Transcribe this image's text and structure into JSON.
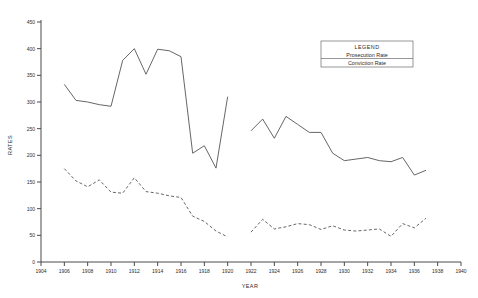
{
  "chart_data": {
    "type": "line",
    "title": "",
    "xlabel": "YEAR",
    "ylabel": "RATES",
    "xlim": [
      1904,
      1940
    ],
    "ylim": [
      0,
      450
    ],
    "xticks": [
      1904,
      1906,
      1908,
      1910,
      1912,
      1914,
      1916,
      1918,
      1920,
      1922,
      1924,
      1926,
      1928,
      1930,
      1932,
      1934,
      1936,
      1938,
      1940
    ],
    "yticks": [
      0,
      50,
      100,
      150,
      200,
      250,
      300,
      350,
      400,
      450
    ],
    "grid": false,
    "legend": {
      "title": "LEGEND",
      "position": "top-right",
      "entries": [
        {
          "label": "Prosecution Rate",
          "style": "solid"
        },
        {
          "label": "Conviction Rate",
          "style": "dashed"
        }
      ]
    },
    "series": [
      {
        "name": "Prosecution Rate",
        "style": "solid",
        "segments": [
          {
            "x": [
              1906,
              1907,
              1908,
              1909,
              1910,
              1911,
              1912,
              1913,
              1914,
              1915,
              1916,
              1917,
              1918,
              1919,
              1920
            ],
            "y": [
              333,
              303,
              300,
              295,
              292,
              378,
              400,
              352,
              399,
              396,
              385,
              204,
              218,
              176,
              310
            ]
          },
          {
            "x": [
              1922,
              1923,
              1924,
              1925,
              1926,
              1927,
              1928,
              1929,
              1930,
              1931,
              1932,
              1933,
              1934,
              1935,
              1936,
              1937
            ],
            "y": [
              246,
              268,
              232,
              273,
              258,
              243,
              243,
              204,
              190,
              193,
              196,
              190,
              188,
              196,
              163,
              172
            ]
          }
        ]
      },
      {
        "name": "Conviction Rate",
        "style": "dashed",
        "segments": [
          {
            "x": [
              1906,
              1907,
              1908,
              1909,
              1910,
              1911,
              1912,
              1913,
              1914,
              1915,
              1916,
              1917,
              1918,
              1919,
              1920
            ],
            "y": [
              175,
              152,
              141,
              154,
              131,
              129,
              158,
              132,
              129,
              124,
              121,
              86,
              76,
              58,
              47
            ]
          },
          {
            "x": [
              1922,
              1923,
              1924,
              1925,
              1926,
              1927,
              1928,
              1929,
              1930,
              1931,
              1932,
              1933,
              1934,
              1935,
              1936,
              1937
            ],
            "y": [
              56,
              80,
              62,
              66,
              72,
              70,
              61,
              68,
              60,
              58,
              60,
              62,
              48,
              72,
              64,
              82
            ]
          }
        ]
      }
    ]
  }
}
